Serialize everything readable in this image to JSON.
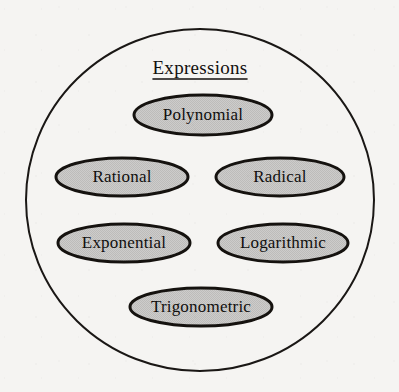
{
  "diagram": {
    "type": "set-diagram",
    "background_color": "#f5f4f2",
    "universe": {
      "shape": "circle",
      "title": "Expressions",
      "title_underlined": true,
      "stroke_color": "#1a1715",
      "fill_color": "#f5f4f2",
      "stroke_width": 2,
      "center_x": 200,
      "center_y": 200,
      "radius_x": 174,
      "radius_y": 171
    },
    "members": [
      {
        "id": "polynomial",
        "label": "Polynomial",
        "cx": 203,
        "cy": 115,
        "rx": 69,
        "ry": 20,
        "fill_color": "#c9c8c6",
        "stroke_color": "#15120f",
        "row": 1,
        "column": "center"
      },
      {
        "id": "rational",
        "label": "Rational",
        "cx": 122,
        "cy": 177,
        "rx": 66,
        "ry": 19,
        "fill_color": "#c9c8c6",
        "stroke_color": "#15120f",
        "row": 2,
        "column": "left"
      },
      {
        "id": "radical",
        "label": "Radical",
        "cx": 280,
        "cy": 177,
        "rx": 64,
        "ry": 19,
        "fill_color": "#c9c8c6",
        "stroke_color": "#15120f",
        "row": 2,
        "column": "right"
      },
      {
        "id": "exponential",
        "label": "Exponential",
        "cx": 124,
        "cy": 243,
        "rx": 66,
        "ry": 19,
        "fill_color": "#c9c8c6",
        "stroke_color": "#15120f",
        "row": 3,
        "column": "left"
      },
      {
        "id": "logarithmic",
        "label": "Logarithmic",
        "cx": 283,
        "cy": 243,
        "rx": 65,
        "ry": 19,
        "fill_color": "#c9c8c6",
        "stroke_color": "#15120f",
        "row": 3,
        "column": "right"
      },
      {
        "id": "trigonometric",
        "label": "Trigonometric",
        "cx": 201,
        "cy": 307,
        "rx": 71,
        "ry": 19,
        "fill_color": "#c9c8c6",
        "stroke_color": "#15120f",
        "row": 4,
        "column": "center"
      }
    ]
  }
}
